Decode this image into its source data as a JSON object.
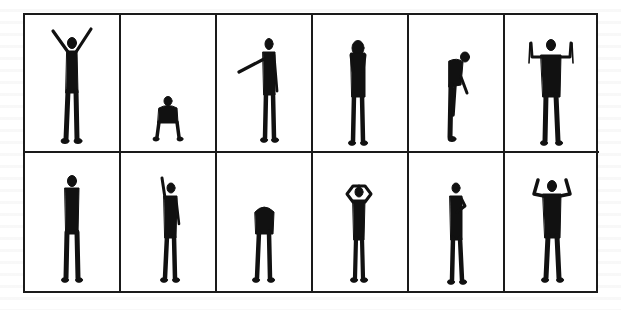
{
  "figure": {
    "layout": {
      "rows": 2,
      "columns": 6
    },
    "colors": {
      "border": "#1a1a1a",
      "silhouette": "#111111",
      "background": "#ffffff"
    },
    "cells": [
      {
        "row": 1,
        "col": 1,
        "pose": "both-arms-raised-v"
      },
      {
        "row": 1,
        "col": 2,
        "pose": "crouching"
      },
      {
        "row": 1,
        "col": 3,
        "pose": "pointing-left"
      },
      {
        "row": 1,
        "col": 4,
        "pose": "hands-covering-face"
      },
      {
        "row": 1,
        "col": 5,
        "pose": "bending-forward-sideways"
      },
      {
        "row": 1,
        "col": 6,
        "pose": "both-arms-up-holding-objects"
      },
      {
        "row": 2,
        "col": 1,
        "pose": "standing-arms-at-sides"
      },
      {
        "row": 2,
        "col": 2,
        "pose": "one-arm-raised"
      },
      {
        "row": 2,
        "col": 3,
        "pose": "head-bowed-forward"
      },
      {
        "row": 2,
        "col": 4,
        "pose": "hands-on-head"
      },
      {
        "row": 2,
        "col": 5,
        "pose": "hand-on-chest"
      },
      {
        "row": 2,
        "col": 6,
        "pose": "arms-flexed-up"
      }
    ]
  }
}
